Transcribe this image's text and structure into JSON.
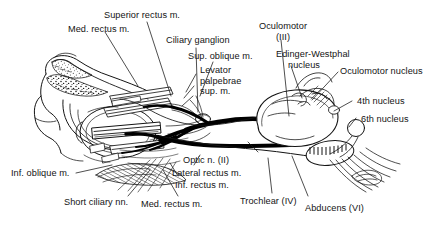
{
  "figure": {
    "width": 426,
    "height": 226,
    "style": "black and white line drawing, sagittal/oblique view of orbit and brainstem",
    "ink_color": "#141414",
    "background_color": "#ffffff"
  },
  "labels": {
    "med_rectus_top": "Med. rectus m.",
    "superior_rectus": "Superior rectus m.",
    "ciliary_ganglion": "Ciliary ganglion",
    "sup_oblique": "Sup. oblique m.",
    "levator_line1": "Levator",
    "levator_line2": "palpebrae",
    "levator_line3": "sup. m.",
    "oculomotor_line1": "Oculomotor",
    "oculomotor_line2": "(III)",
    "edinger_line1": "Edinger-Westphal",
    "edinger_line2": "nucleus",
    "oculomotor_nucleus": "Oculomotor nucleus",
    "fourth_nucleus": "4th nucleus",
    "sixth_nucleus": "6th nucleus",
    "inf_oblique": "Inf. oblique m.",
    "short_ciliary": "Short ciliary nn.",
    "med_rectus_bottom": "Med. rectus m.",
    "optic_nerve": "Optic n. (II)",
    "lateral_rectus": "Lateral rectus m.",
    "inf_rectus": "Inf. rectus m.",
    "trochlear": "Trochlear (IV)",
    "abducens": "Abducens (VI)"
  },
  "structures": [
    {
      "name": "orbit-bone-frontal",
      "note": "stippled frontal bone, upper left"
    },
    {
      "name": "eyeball",
      "note": "globe of the eye, left-centre"
    },
    {
      "name": "brainstem",
      "note": "midbrain / pons outline, right side"
    },
    {
      "name": "oculomotor-nerve-trunk",
      "note": "thick black nerve from midbrain to orbit"
    },
    {
      "name": "trochlear-nerve",
      "note": "thin nerve to superior oblique"
    },
    {
      "name": "abducens-nerve",
      "note": "nerve from pons to lateral rectus"
    },
    {
      "name": "cerebellum-hatching",
      "note": "cross-hatched region lower right"
    }
  ]
}
